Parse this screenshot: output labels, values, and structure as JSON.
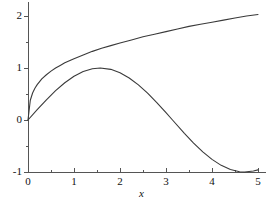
{
  "chart_data": {
    "type": "line",
    "title": "",
    "subtitle": "",
    "xlabel": "x",
    "ylabel": "",
    "xlim": [
      0,
      5
    ],
    "ylim": [
      -1,
      2.2
    ],
    "grid": false,
    "legend": null,
    "x_ticks": [
      0,
      1,
      2,
      3,
      4,
      5
    ],
    "x_tick_labels": [
      "0",
      "1",
      "2",
      "3",
      "4",
      "5"
    ],
    "y_ticks": [
      -1,
      0,
      1,
      2
    ],
    "y_tick_labels": [
      "-1",
      "0",
      "1",
      "2"
    ],
    "x_minor_ticks": [
      0.5,
      1.5,
      2.5,
      3.5,
      4.5
    ],
    "y_minor_ticks": [
      -0.5,
      0.5,
      1.5
    ],
    "axis_color": "#555555",
    "curve_color": "#3a3a3a",
    "background": "#ffffff",
    "series": [
      {
        "name": "upper-curve",
        "color": "#3a3a3a",
        "x": [
          0,
          0.05,
          0.1,
          0.15,
          0.2,
          0.3,
          0.4,
          0.5,
          0.6,
          0.7,
          0.8,
          0.9,
          1.0,
          1.2,
          1.4,
          1.6,
          1.8,
          2.0,
          2.25,
          2.5,
          2.75,
          3.0,
          3.25,
          3.5,
          3.75,
          4.0,
          4.25,
          4.5,
          4.75,
          5.0
        ],
        "y": [
          0,
          0.38,
          0.52,
          0.61,
          0.68,
          0.79,
          0.87,
          0.94,
          1.0,
          1.05,
          1.1,
          1.14,
          1.18,
          1.25,
          1.32,
          1.38,
          1.43,
          1.48,
          1.54,
          1.6,
          1.65,
          1.7,
          1.75,
          1.8,
          1.84,
          1.88,
          1.92,
          1.96,
          2.0,
          2.03
        ]
      },
      {
        "name": "lower-curve",
        "color": "#3a3a3a",
        "x": [
          0,
          0.2,
          0.4,
          0.6,
          0.8,
          1.0,
          1.2,
          1.4,
          1.5708,
          1.8,
          2.0,
          2.2,
          2.4,
          2.6,
          2.8,
          3.0,
          3.1416,
          3.4,
          3.6,
          3.8,
          4.0,
          4.2,
          4.4,
          4.6,
          4.7124,
          4.9,
          5.0
        ],
        "y": [
          0,
          0.199,
          0.389,
          0.565,
          0.717,
          0.841,
          0.932,
          0.985,
          1.0,
          0.974,
          0.909,
          0.808,
          0.675,
          0.516,
          0.335,
          0.141,
          0.0,
          -0.256,
          -0.443,
          -0.612,
          -0.757,
          -0.872,
          -0.952,
          -0.994,
          -1.0,
          -0.982,
          -0.959
        ]
      }
    ]
  },
  "axis_title": {
    "x": "x"
  }
}
